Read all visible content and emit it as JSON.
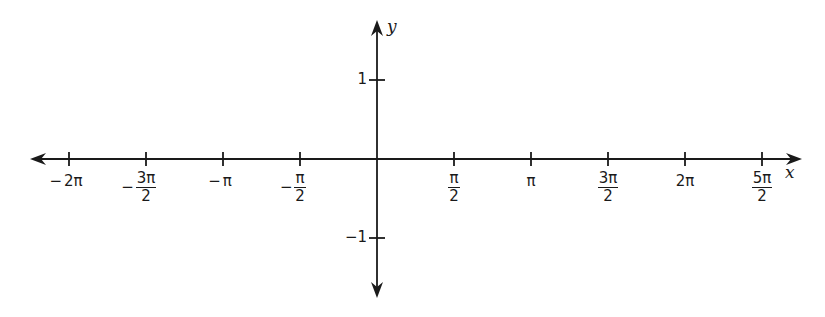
{
  "chart_data": {
    "type": "line",
    "title": "",
    "xlabel": "x",
    "ylabel": "y",
    "grid": false,
    "series": [],
    "x_ticks": [
      {
        "value": "-2π",
        "numeric": -6.2832,
        "neg": "−",
        "whole": "2π",
        "num": "",
        "den": ""
      },
      {
        "value": "-3π/2",
        "numeric": -4.7124,
        "neg": "−",
        "whole": "",
        "num": "3π",
        "den": "2"
      },
      {
        "value": "-π",
        "numeric": -3.1416,
        "neg": "−",
        "whole": "π",
        "num": "",
        "den": ""
      },
      {
        "value": "-π/2",
        "numeric": -1.5708,
        "neg": "−",
        "whole": "",
        "num": "π",
        "den": "2"
      },
      {
        "value": "π/2",
        "numeric": 1.5708,
        "neg": "",
        "whole": "",
        "num": "π",
        "den": "2"
      },
      {
        "value": "π",
        "numeric": 3.1416,
        "neg": "",
        "whole": "π",
        "num": "",
        "den": ""
      },
      {
        "value": "3π/2",
        "numeric": 4.7124,
        "neg": "",
        "whole": "",
        "num": "3π",
        "den": "2"
      },
      {
        "value": "2π",
        "numeric": 6.2832,
        "neg": "",
        "whole": "2π",
        "num": "",
        "den": ""
      },
      {
        "value": "5π/2",
        "numeric": 7.854,
        "neg": "",
        "whole": "",
        "num": "5π",
        "den": "2"
      }
    ],
    "y_ticks": [
      {
        "value": "1",
        "numeric": 1
      },
      {
        "value": "−1",
        "numeric": -1
      }
    ],
    "xlim": [
      -7.3,
      8.5
    ],
    "ylim": [
      -1.75,
      1.75
    ]
  },
  "axes": {
    "x_label": "x",
    "y_label": "y",
    "color": "#1a1a1a"
  }
}
